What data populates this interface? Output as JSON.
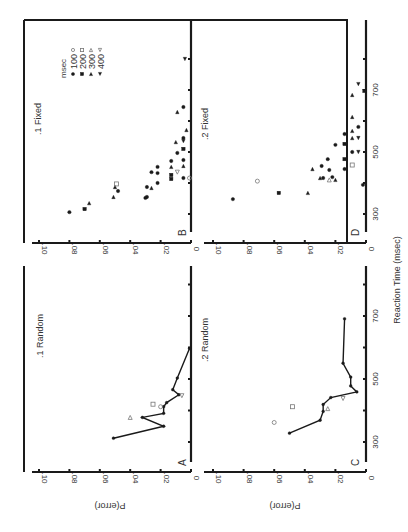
{
  "figure": {
    "xlabel": "Reaction Time (msec)",
    "ylabel": "P(error)",
    "orientation": "rotated-90-ccw",
    "colors": {
      "ink": "#1a1a1a",
      "text": "#333333",
      "open": "#777777"
    }
  },
  "legend": {
    "title": "msec",
    "entries": [
      {
        "label": "100",
        "filled": "circle",
        "open": "circle"
      },
      {
        "label": "200",
        "filled": "square",
        "open": "square"
      },
      {
        "label": "300",
        "filled": "triangle-up",
        "open": "triangle-up"
      },
      {
        "label": "400",
        "filled": "triangle-down",
        "open": "triangle-down"
      }
    ]
  },
  "panels": {
    "A": {
      "letter": "A",
      "title": ".1 Random"
    },
    "B": {
      "letter": "B",
      "title": ".1 Fixed"
    },
    "C": {
      "letter": "C",
      "title": ".2 Random"
    },
    "D": {
      "letter": "D",
      "title": ".2 Fixed"
    }
  },
  "chart_data": [
    {
      "panel": "A",
      "type": "line",
      "title": ".1 Random",
      "xlabel": "Reaction Time (msec)",
      "ylabel": "P(error)",
      "xticks": [
        300,
        500,
        700
      ],
      "yticks": [
        "0",
        ".02",
        ".04",
        ".06",
        ".08",
        ".10"
      ],
      "xlim": [
        200,
        800
      ],
      "ylim": [
        0,
        0.1
      ],
      "series": [
        {
          "name": "mean",
          "x": [
            312,
            350,
            378,
            391,
            412,
            425,
            450,
            466,
            503,
            597
          ],
          "y": [
            0.051,
            0.018,
            0.032,
            0.018,
            0.018,
            0.016,
            0.008,
            0.012,
            0.009,
            0.001
          ]
        },
        {
          "name": "open markers",
          "points": [
            {
              "x": 378,
              "y": 0.04,
              "marker": "triangle-up"
            },
            {
              "x": 420,
              "y": 0.025,
              "marker": "square"
            },
            {
              "x": 412,
              "y": 0.02,
              "marker": "circle"
            },
            {
              "x": 447,
              "y": 0.006,
              "marker": "triangle-down"
            }
          ]
        }
      ]
    },
    {
      "panel": "B",
      "type": "scatter",
      "title": ".1 Fixed",
      "xlabel": "Reaction Time (msec)",
      "ylabel": "P(error)",
      "xticks": [
        300,
        500,
        700
      ],
      "yticks": [
        "0",
        ".02",
        ".04",
        ".06",
        ".08",
        ".10"
      ],
      "xlim": [
        200,
        800
      ],
      "ylim": [
        0,
        0.1
      ],
      "points": [
        {
          "x": 306,
          "y": 0.08,
          "marker": "circle"
        },
        {
          "x": 316,
          "y": 0.07,
          "marker": "square"
        },
        {
          "x": 335,
          "y": 0.067,
          "marker": "triangle-up"
        },
        {
          "x": 355,
          "y": 0.051,
          "marker": "triangle-up"
        },
        {
          "x": 374,
          "y": 0.048,
          "marker": "circle"
        },
        {
          "x": 387,
          "y": 0.05,
          "marker": "triangle-up"
        },
        {
          "x": 397,
          "y": 0.049,
          "marker": "square",
          "open": true
        },
        {
          "x": 352,
          "y": 0.03,
          "marker": "circle"
        },
        {
          "x": 355,
          "y": 0.029,
          "marker": "circle"
        },
        {
          "x": 387,
          "y": 0.029,
          "marker": "circle"
        },
        {
          "x": 384,
          "y": 0.026,
          "marker": "triangle-up"
        },
        {
          "x": 400,
          "y": 0.022,
          "marker": "circle"
        },
        {
          "x": 435,
          "y": 0.026,
          "marker": "circle"
        },
        {
          "x": 432,
          "y": 0.022,
          "marker": "circle"
        },
        {
          "x": 452,
          "y": 0.022,
          "marker": "circle"
        },
        {
          "x": 413,
          "y": 0.013,
          "marker": "square"
        },
        {
          "x": 426,
          "y": 0.013,
          "marker": "square"
        },
        {
          "x": 435,
          "y": 0.009,
          "marker": "triangle-down",
          "open": true
        },
        {
          "x": 452,
          "y": 0.013,
          "marker": "triangle-up"
        },
        {
          "x": 471,
          "y": 0.013,
          "marker": "circle"
        },
        {
          "x": 416,
          "y": 0.005,
          "marker": "circle"
        },
        {
          "x": 455,
          "y": 0.005,
          "marker": "triangle-up"
        },
        {
          "x": 474,
          "y": 0.005,
          "marker": "circle"
        },
        {
          "x": 497,
          "y": 0.009,
          "marker": "circle"
        },
        {
          "x": 510,
          "y": 0.005,
          "marker": "square"
        },
        {
          "x": 535,
          "y": 0.005,
          "marker": "triangle-down"
        },
        {
          "x": 532,
          "y": 0.01,
          "marker": "triangle-up"
        },
        {
          "x": 545,
          "y": 0.005,
          "marker": "circle"
        },
        {
          "x": 571,
          "y": 0.003,
          "marker": "triangle-up"
        },
        {
          "x": 629,
          "y": 0.009,
          "marker": "triangle-up"
        },
        {
          "x": 645,
          "y": 0.005,
          "marker": "circle"
        },
        {
          "x": 800,
          "y": 0.004,
          "marker": "triangle-down"
        },
        {
          "x": 416,
          "y": 0.001,
          "marker": "circle",
          "open": true
        }
      ]
    },
    {
      "panel": "C",
      "type": "line",
      "title": ".2 Random",
      "xlabel": "Reaction Time (msec)",
      "ylabel": "P(error)",
      "xticks": [
        300,
        500,
        700
      ],
      "yticks": [
        "0",
        ".02",
        ".04",
        ".06",
        ".08",
        ".10"
      ],
      "xlim": [
        200,
        800
      ],
      "ylim": [
        0,
        0.1
      ],
      "series": [
        {
          "name": "mean",
          "x": [
            328,
            369,
            397,
            419,
            441,
            459,
            478,
            506,
            550,
            691
          ],
          "y": [
            0.05,
            0.03,
            0.028,
            0.028,
            0.023,
            0.006,
            0.01,
            0.01,
            0.015,
            0.014
          ]
        },
        {
          "name": "open markers",
          "points": [
            {
              "x": 362,
              "y": 0.06,
              "marker": "circle"
            },
            {
              "x": 412,
              "y": 0.048,
              "marker": "square"
            },
            {
              "x": 406,
              "y": 0.025,
              "marker": "triangle-up"
            },
            {
              "x": 438,
              "y": 0.015,
              "marker": "triangle-down"
            }
          ]
        }
      ]
    },
    {
      "panel": "D",
      "type": "scatter",
      "title": ".2 Fixed",
      "xlabel": "Reaction Time (msec)",
      "ylabel": "P(error)",
      "xticks": [
        300,
        500,
        700
      ],
      "yticks": [
        "0",
        ".02",
        ".04",
        ".06",
        ".08",
        ".10"
      ],
      "xlim": [
        200,
        800
      ],
      "ylim": [
        0,
        0.1
      ],
      "points": [
        {
          "x": 348,
          "y": 0.087,
          "marker": "circle"
        },
        {
          "x": 406,
          "y": 0.071,
          "marker": "circle",
          "open": true
        },
        {
          "x": 368,
          "y": 0.057,
          "marker": "square"
        },
        {
          "x": 368,
          "y": 0.038,
          "marker": "triangle-up"
        },
        {
          "x": 445,
          "y": 0.035,
          "marker": "triangle-up"
        },
        {
          "x": 455,
          "y": 0.029,
          "marker": "circle"
        },
        {
          "x": 477,
          "y": 0.025,
          "marker": "circle"
        },
        {
          "x": 416,
          "y": 0.03,
          "marker": "triangle-up"
        },
        {
          "x": 416,
          "y": 0.028,
          "marker": "circle"
        },
        {
          "x": 442,
          "y": 0.024,
          "marker": "circle"
        },
        {
          "x": 410,
          "y": 0.024,
          "marker": "triangle-up",
          "open": true
        },
        {
          "x": 419,
          "y": 0.022,
          "marker": "circle"
        },
        {
          "x": 410,
          "y": 0.02,
          "marker": "triangle-up"
        },
        {
          "x": 523,
          "y": 0.02,
          "marker": "circle"
        },
        {
          "x": 558,
          "y": 0.014,
          "marker": "circle"
        },
        {
          "x": 526,
          "y": 0.014,
          "marker": "square"
        },
        {
          "x": 477,
          "y": 0.014,
          "marker": "square"
        },
        {
          "x": 445,
          "y": 0.014,
          "marker": "circle"
        },
        {
          "x": 458,
          "y": 0.009,
          "marker": "square",
          "open": true
        },
        {
          "x": 500,
          "y": 0.009,
          "marker": "circle"
        },
        {
          "x": 545,
          "y": 0.009,
          "marker": "triangle-up"
        },
        {
          "x": 568,
          "y": 0.009,
          "marker": "triangle-up"
        },
        {
          "x": 613,
          "y": 0.009,
          "marker": "triangle-up"
        },
        {
          "x": 684,
          "y": 0.009,
          "marker": "triangle-up"
        },
        {
          "x": 500,
          "y": 0.005,
          "marker": "triangle-down"
        },
        {
          "x": 545,
          "y": 0.005,
          "marker": "triangle-down"
        },
        {
          "x": 581,
          "y": 0.005,
          "marker": "circle"
        },
        {
          "x": 719,
          "y": 0.005,
          "marker": "triangle-down"
        },
        {
          "x": 394,
          "y": 0.002,
          "marker": "circle"
        },
        {
          "x": 697,
          "y": 0.001,
          "marker": "square"
        }
      ]
    }
  ]
}
